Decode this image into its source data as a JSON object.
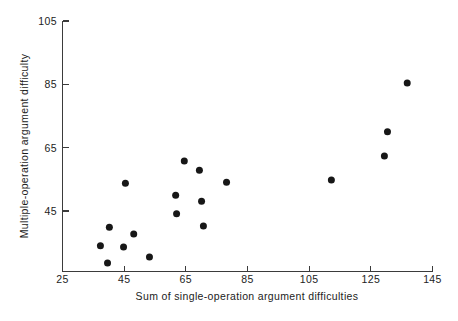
{
  "chart_data": {
    "type": "scatter",
    "title": "",
    "xlabel": "Sum of single-operation argument difficulties",
    "ylabel": "Multiple-operation argument difficulty",
    "xlim": [
      25,
      145
    ],
    "ylim": [
      25,
      105
    ],
    "xticks": [
      25,
      45,
      65,
      85,
      105,
      125,
      145
    ],
    "yticks": [
      45,
      65,
      85,
      105
    ],
    "xtick_labels": [
      "25",
      "45",
      "65",
      "85",
      "105",
      "125",
      "145"
    ],
    "ytick_labels": [
      "45",
      "65",
      "85",
      "105"
    ],
    "grid": false,
    "legend": null,
    "marker": "filled-circle",
    "marker_color": "#171717",
    "marker_size": 7,
    "points": [
      {
        "x": 37.3,
        "y": 34.0
      },
      {
        "x": 39.6,
        "y": 28.6
      },
      {
        "x": 40.2,
        "y": 39.9
      },
      {
        "x": 44.8,
        "y": 33.6
      },
      {
        "x": 45.4,
        "y": 53.8
      },
      {
        "x": 48.1,
        "y": 37.7
      },
      {
        "x": 53.2,
        "y": 30.5
      },
      {
        "x": 61.7,
        "y": 50.0
      },
      {
        "x": 62.0,
        "y": 44.1
      },
      {
        "x": 64.5,
        "y": 60.8
      },
      {
        "x": 69.4,
        "y": 57.9
      },
      {
        "x": 70.1,
        "y": 48.1
      },
      {
        "x": 70.7,
        "y": 40.3
      },
      {
        "x": 78.2,
        "y": 54.1
      },
      {
        "x": 112.2,
        "y": 54.8
      },
      {
        "x": 129.4,
        "y": 62.4
      },
      {
        "x": 130.4,
        "y": 70.0
      },
      {
        "x": 136.8,
        "y": 85.4
      }
    ]
  },
  "figure": {
    "background": "#ffffff",
    "axis_color": "#3b3b3b",
    "text_color": "#1c1c1c"
  }
}
